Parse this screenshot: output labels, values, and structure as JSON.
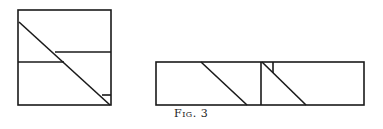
{
  "figure": {
    "caption": "Fig. 3",
    "stroke_color": "#1a1a1a",
    "background": "#ffffff"
  },
  "left_square": {
    "outline": {
      "x": 18,
      "y": 10,
      "w": 93,
      "h": 95
    },
    "diagonal": {
      "x1": 19,
      "y1": 22,
      "x2": 110,
      "y2": 105
    },
    "upper_horizontal": {
      "x1": 55,
      "y1": 52,
      "x2": 111,
      "y2": 52
    },
    "lower_horizontal": {
      "x1": 18,
      "y1": 62,
      "x2": 64,
      "y2": 62
    },
    "corner_tick": {
      "x1": 102,
      "y1": 95,
      "x2": 111,
      "y2": 95
    }
  },
  "right_rectangle": {
    "outline": {
      "x": 156,
      "y": 62,
      "w": 208,
      "h": 43
    },
    "divider": {
      "x1": 261,
      "y1": 62,
      "x2": 261,
      "y2": 105
    },
    "diagonal_left": {
      "x1": 201,
      "y1": 62,
      "x2": 247,
      "y2": 105
    },
    "diagonal_right": {
      "x1": 262,
      "y1": 62,
      "x2": 306,
      "y2": 105
    },
    "small_vertical": {
      "x1": 273,
      "y1": 62,
      "x2": 273,
      "y2": 73
    }
  }
}
